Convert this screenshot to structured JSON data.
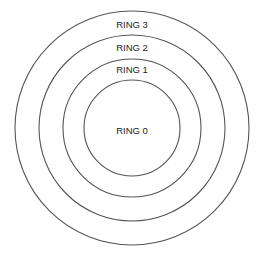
{
  "diagram": {
    "type": "concentric-rings",
    "center": {
      "x": 132,
      "y": 128
    },
    "stroke_color": "#555555",
    "text_color": "#222222",
    "background": "#ffffff",
    "rings": [
      {
        "label": "RING 3",
        "r": 117,
        "label_y": 25
      },
      {
        "label": "RING 2",
        "r": 93,
        "label_y": 48
      },
      {
        "label": "RING 1",
        "r": 69,
        "label_y": 70
      },
      {
        "label": "RING 0",
        "r": 48,
        "label_y": 131
      }
    ]
  }
}
